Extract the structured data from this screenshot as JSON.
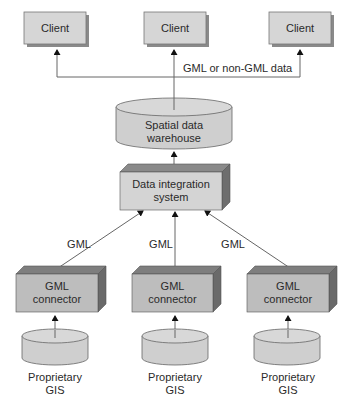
{
  "clients": [
    {
      "label": "Client"
    },
    {
      "label": "Client"
    },
    {
      "label": "Client"
    }
  ],
  "bus_label": "GML or non-GML data",
  "warehouse": {
    "line1": "Spatial data",
    "line2": "warehouse"
  },
  "integration": {
    "line1": "Data integration",
    "line2": "system"
  },
  "edge_labels": [
    "GML",
    "GML",
    "GML"
  ],
  "connectors": [
    {
      "line1": "GML",
      "line2": "connector"
    },
    {
      "line1": "GML",
      "line2": "connector"
    },
    {
      "line1": "GML",
      "line2": "connector"
    }
  ],
  "sources": [
    {
      "line1": "Proprietary",
      "line2": "GIS"
    },
    {
      "line1": "Proprietary",
      "line2": "GIS"
    },
    {
      "line1": "Proprietary",
      "line2": "GIS"
    }
  ],
  "colors": {
    "box_fill": "#d4d4d4",
    "box_top": "#8a8a8a",
    "box_side": "#6e6e6e",
    "line": "#555555"
  }
}
